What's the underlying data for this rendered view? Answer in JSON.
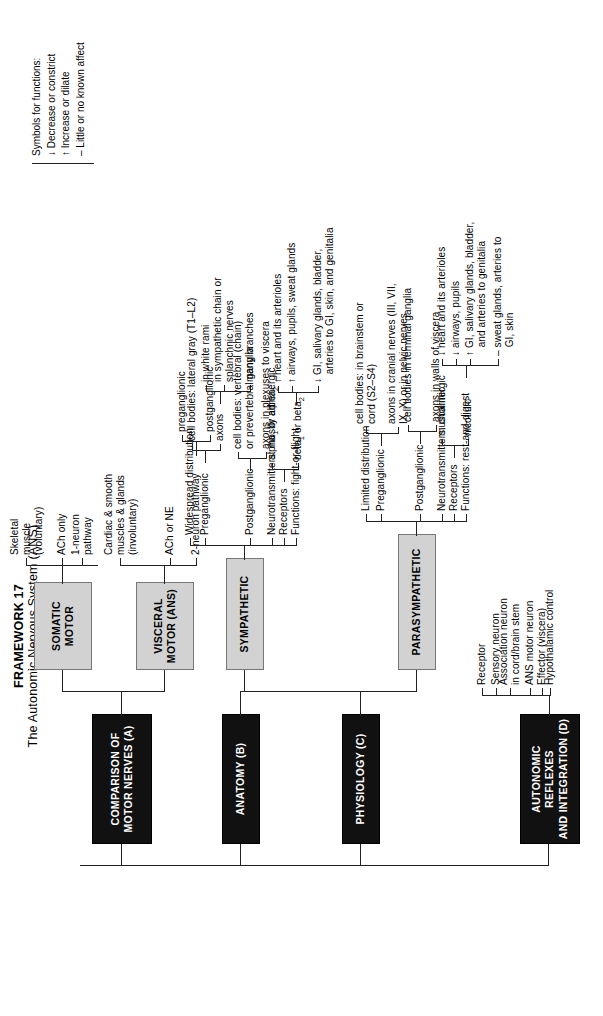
{
  "title": {
    "framework": "FRAMEWORK 17",
    "subtitle": "The Autonomic Nervous System (ANS)"
  },
  "colors": {
    "black_box": "#111111",
    "gray_box": "#d2d2d2",
    "line": "#222222",
    "page": "#ffffff"
  },
  "sections": {
    "comparison": {
      "label": "COMPARISON OF\nMOTOR NERVES (A)"
    },
    "anatomy": {
      "label": "ANATOMY (B)"
    },
    "physiology": {
      "label": "PHYSIOLOGY (C)"
    },
    "reflexes": {
      "label": "AUTONOMIC REFLEXES\nAND INTEGRATION (D)"
    }
  },
  "boxes": {
    "somatic": {
      "label": "SOMATIC\nMOTOR"
    },
    "visceral": {
      "label": "VISCERAL\nMOTOR (ANS)"
    },
    "sympathetic": {
      "label": "SYMPATHETIC"
    },
    "parasympathetic": {
      "label": "PARASYMPATHETIC"
    }
  },
  "somatic_items": {
    "i1": "Skeletal\nmuscle\n(voluntary)",
    "i2": "ACh only",
    "i3": "1-neuron\npathway"
  },
  "visceral_items": {
    "i1": "Cardiac & smooth\nmuscles & glands\n(involuntary)",
    "i2": "ACh or NE",
    "i3": "2-neuron pathway",
    "i3a": "preganglionic",
    "i3b": "postganglionic"
  },
  "sympathetic_items": {
    "i1": "Widespread distribution",
    "i2": "Preganglionic",
    "i2a": "cell bodies: lateral gray (T1–L2)",
    "i2b": "axons",
    "i2b1": "in white rami",
    "i2b2": "in sympathetic chain or\nsplanchnic nerves",
    "i2b3": "many branches",
    "i3": "Postganglionic",
    "i3a": "cell bodies: vertebral (chain)\nor prevertebral ganglia",
    "i3b": "axons in plexuses to viscera",
    "i4": "Neurotransmitters: mostly adrenergic",
    "i5": "Receptors",
    "i5a": "alpha₁ or alpha₂",
    "i5b": "beta₁ or beta₂",
    "i6": "Functions: fight-or-flight",
    "i6a": "↑ heart and its arterioles",
    "i6b": "↑ airways, pupils, sweat glands",
    "i6c": "↓ GI, salivary glands, bladder,\n   arteries to GI, skin, and genitalia"
  },
  "parasympathetic_items": {
    "i1": "Limited distribution",
    "i2": "Preganglionic",
    "i2a": "cell bodies: in brainstem or\ncord (S2–S4)",
    "i2b": "axons in cranial nerves (III, VII,\nIX, X) or in pelvic nerves",
    "i3": "Postganglionic",
    "i3a": "cell bodies in terminal ganglia",
    "i3b": "axons in walls of viscera",
    "i4": "Neurotransmitters: cholinergic",
    "i5": "Receptors",
    "i5a": "muscarinic",
    "i5b": "nicotinic",
    "i6": "Functions: rest-and-digest",
    "i6a": "↓ heart and its arterioles",
    "i6b": "↓ airways, pupils",
    "i6c": "↑ GI, salivary glands, bladder,\n   and arteries to genitalia",
    "i6d": "– sweat glands, arteries to\n   GI, skin"
  },
  "reflex_items": {
    "i1": "Receptor",
    "i2": "Sensory neuron",
    "i3": "Association neuron\nin cord/brain stem",
    "i4": "ANS motor neuron",
    "i5": "Effector (viscera)",
    "i6": "Hypothalamic control"
  },
  "legend": {
    "heading": "Symbols for functions:",
    "l1": "↓ Decrease or constrict",
    "l2": "↑ Increase or dilate",
    "l3": "– Little or no known affect"
  }
}
